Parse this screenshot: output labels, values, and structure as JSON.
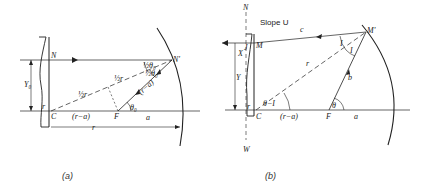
{
  "panel_a": {
    "caption": "(a)",
    "labels": {
      "N": "N",
      "N_prime": "N'",
      "C": "C",
      "F": "F",
      "Y0": "Y₀",
      "half_r_1": "½r",
      "half_r_2": "½r",
      "r_minus_a_axis": "(r−a)",
      "r_minus_a_ray": "(r−a)",
      "a": "a",
      "r": "r",
      "theta0": "θ₀",
      "half_theta0_1": "½θ₀",
      "half_theta0_2": "½θ₀",
      "small_r": "r"
    }
  },
  "panel_b": {
    "caption": "(b)",
    "labels": {
      "N": "N",
      "W": "W",
      "M": "M",
      "M_prime": "M'",
      "C": "C",
      "F": "F",
      "slope": "Slope U",
      "X": "X",
      "Y": "Y",
      "J": "J",
      "c": "c",
      "b": "b",
      "r_ray": "r",
      "r_minus_a": "(r−a)",
      "a": "a",
      "theta": "θ",
      "theta_minus_I": "θ−I",
      "I1": "I",
      "I2": "I",
      "small_r": "r"
    }
  }
}
